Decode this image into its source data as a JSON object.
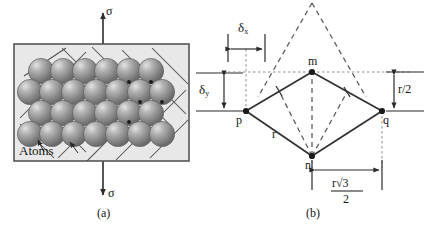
{
  "figure": {
    "panel_a": {
      "caption": "(a)",
      "stress_top_label": "σ",
      "stress_bottom_label": "σ",
      "atoms_label": "Atoms",
      "delta_y_symbol": "δ",
      "delta_y_sub": "y",
      "box_fill": "#e8e8e8",
      "box_stroke": "#555555",
      "atom_fill": "#8d8d8d",
      "atom_highlight": "#d8d8d8",
      "lattice_line_color": "#4a4a4a",
      "rows": 5,
      "cols": 6
    },
    "panel_b": {
      "caption": "(b)",
      "nodes": [
        {
          "id": "p",
          "label": "p",
          "x": 246,
          "y": 111
        },
        {
          "id": "m",
          "label": "m",
          "x": 312,
          "y": 72
        },
        {
          "id": "q",
          "label": "q",
          "x": 382,
          "y": 111
        },
        {
          "id": "n",
          "label": "n",
          "x": 312,
          "y": 156
        }
      ],
      "edge_label_r": "r",
      "delta_x_symbol": "δ",
      "delta_x_sub": "x",
      "r_half_label": "r/2",
      "base_numerator": "r√3",
      "base_denominator": "2",
      "solid_line_color": "#303030",
      "dashed_line_color": "#5a5a5a",
      "dotted_guide_color": "#8a8a8a",
      "node_fill": "#1a1a1a"
    }
  }
}
